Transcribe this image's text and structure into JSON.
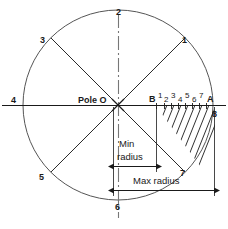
{
  "diagram": {
    "type": "engineering-drawing",
    "geometry": {
      "center": {
        "x": 118,
        "y": 105,
        "label": "Pole O"
      },
      "radius": 95,
      "min_radius_px": 43,
      "max_radius_px": 97,
      "spoke_angles_deg": [
        45,
        90,
        135,
        180,
        225,
        270,
        315,
        0
      ],
      "hatch_angle_deg": 60,
      "hatch_spacing_px": 7
    },
    "colors": {
      "line": "#1a1a1a",
      "arc": "#555555",
      "hatch": "#1a1a1a",
      "center_line": "#666666",
      "background": "#ffffff"
    },
    "center_label": "Pole O",
    "spoke_labels": [
      {
        "id": "spoke-1",
        "text": "1",
        "x": 182,
        "y": 36
      },
      {
        "id": "spoke-2",
        "text": "2",
        "x": 116,
        "y": 8
      },
      {
        "id": "spoke-3",
        "text": "3",
        "x": 40,
        "y": 36
      },
      {
        "id": "spoke-4",
        "text": "4",
        "x": 11,
        "y": 96
      },
      {
        "id": "spoke-5",
        "text": "5",
        "x": 39,
        "y": 173
      },
      {
        "id": "spoke-6",
        "text": "6",
        "x": 115,
        "y": 203
      },
      {
        "id": "spoke-7",
        "text": "7",
        "x": 180,
        "y": 169
      },
      {
        "id": "spoke-8",
        "text": "8",
        "x": 212,
        "y": 110
      }
    ],
    "axis_point_labels": [
      {
        "id": "point-B",
        "text": "B",
        "x": 149,
        "y": 96
      },
      {
        "id": "div-1",
        "text": "1",
        "x": 158,
        "y": 94
      },
      {
        "id": "div-2",
        "text": "2",
        "x": 165,
        "y": 98
      },
      {
        "id": "div-3",
        "text": "3",
        "x": 172,
        "y": 94
      },
      {
        "id": "div-4",
        "text": "4",
        "x": 179,
        "y": 98
      },
      {
        "id": "div-5",
        "text": "5",
        "x": 186,
        "y": 94
      },
      {
        "id": "div-6",
        "text": "6",
        "x": 193,
        "y": 98
      },
      {
        "id": "div-7",
        "text": "7",
        "x": 200,
        "y": 94
      },
      {
        "id": "point-A",
        "text": "A",
        "x": 208,
        "y": 96
      }
    ],
    "dimensions": [
      {
        "id": "min-radius",
        "line1": "Min",
        "line2": "radius",
        "from_x": 113,
        "to_x": 156,
        "y": 166,
        "text_x": 117,
        "text_y": 141
      },
      {
        "id": "max-radius",
        "line1": "Max radius",
        "line2": "",
        "from_x": 113,
        "to_x": 215,
        "y": 190,
        "text_x": 131,
        "text_y": 178
      }
    ]
  }
}
